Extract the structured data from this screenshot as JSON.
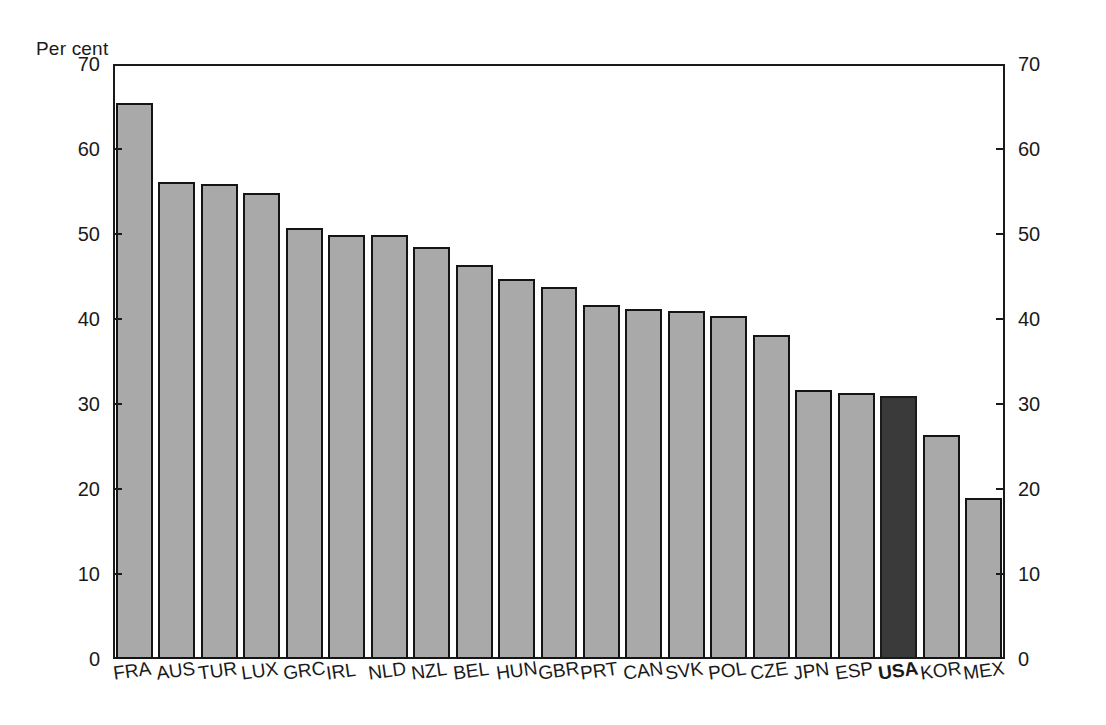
{
  "chart_data": {
    "type": "bar",
    "title": "",
    "subtitle": "",
    "unit_label": "Per cent",
    "xlabel": "",
    "ylabel": "",
    "ylim": [
      0,
      70
    ],
    "yticks": [
      0,
      10,
      20,
      30,
      40,
      50,
      60,
      70
    ],
    "ytick_labels": [
      "0",
      "10",
      "20",
      "30",
      "40",
      "50",
      "60",
      "70"
    ],
    "grid": false,
    "legend": "none",
    "dual_y_axis": true,
    "axis_left_labels": [
      "70",
      "60",
      "50",
      "40",
      "30",
      "20",
      "10",
      "0"
    ],
    "axis_right_labels": [
      "70",
      "60",
      "50",
      "40",
      "30",
      "20",
      "10",
      "0"
    ],
    "categories": [
      "FRA",
      "AUS",
      "TUR",
      "LUX",
      "GRC",
      "IRL",
      "NLD",
      "NZL",
      "BEL",
      "HUN",
      "GBR",
      "PRT",
      "CAN",
      "SVK",
      "POL",
      "CZE",
      "JPN",
      "ESP",
      "USA",
      "KOR",
      "MEX"
    ],
    "values": [
      65.4,
      56.1,
      55.9,
      54.8,
      50.7,
      49.9,
      49.9,
      48.5,
      46.4,
      44.7,
      43.8,
      41.6,
      41.2,
      40.9,
      40.3,
      38.1,
      31.6,
      31.3,
      31.0,
      26.4,
      18.9
    ],
    "highlight_category": "USA",
    "colors": {
      "bar_fill": "#a9a9a9",
      "bar_highlight_fill": "#3a3a3a",
      "bar_edge": "#141414",
      "axis": "#1a1a1a",
      "background": "#ffffff",
      "text": "#1a1a1a"
    }
  }
}
